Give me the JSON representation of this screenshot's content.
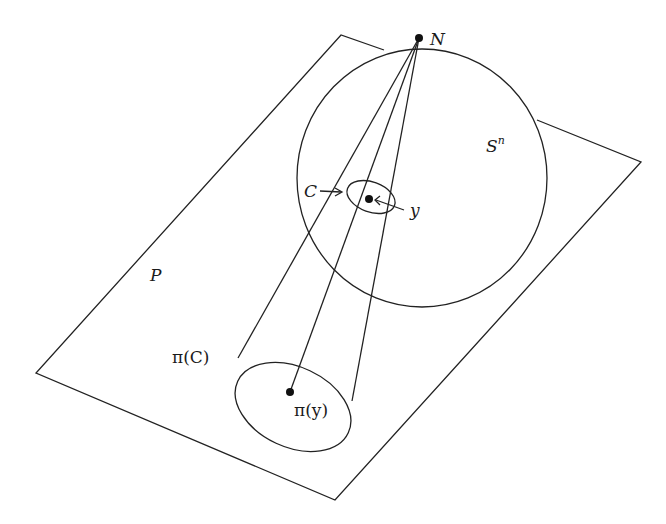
{
  "figure": {
    "type": "stereographic-projection-diagram",
    "colors": {
      "stroke": "#222222",
      "text": "#1a1a1a",
      "background": "#ffffff"
    },
    "labels": {
      "north_pole": "N",
      "sphere_base": "S",
      "sphere_exponent": "n",
      "plane": "P",
      "circle_on_sphere": "C",
      "point_on_sphere": "y",
      "projected_circle_pi": "π",
      "projected_circle_arg": "(C)",
      "projected_point_pi": "π",
      "projected_point_arg": "(y)"
    },
    "elements": [
      {
        "id": "plane",
        "kind": "parallelogram",
        "label": "P"
      },
      {
        "id": "sphere",
        "kind": "circle",
        "label": "S^n"
      },
      {
        "id": "north-pole",
        "kind": "point",
        "label": "N"
      },
      {
        "id": "circle-c",
        "kind": "ellipse",
        "label": "C"
      },
      {
        "id": "point-y",
        "kind": "point",
        "label": "y"
      },
      {
        "id": "projected-circle",
        "kind": "ellipse",
        "label": "π(C)"
      },
      {
        "id": "projected-point",
        "kind": "point",
        "label": "π(y)"
      },
      {
        "id": "projection-lines",
        "kind": "lines",
        "from": "N",
        "to": [
          "π(C) tangent left",
          "π(y)",
          "π(C) tangent right"
        ]
      }
    ]
  }
}
